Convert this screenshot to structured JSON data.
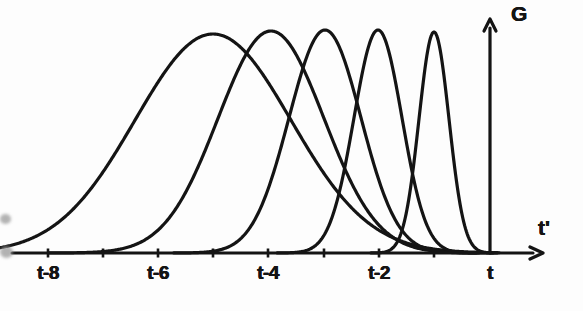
{
  "figure": {
    "background_color": "#fdfdfd",
    "ink_color": "#141414",
    "line_width_px": 3.2
  },
  "axes": {
    "x_axis": {
      "name": "x-axis",
      "label": "t'",
      "label_x": 538,
      "label_y": 216,
      "baseline_y": 253,
      "start_x": 12,
      "arrow_tip_x": 543,
      "tick_height_px": 9
    },
    "y_axis": {
      "name": "y-axis",
      "label": "G",
      "label_x": 511,
      "label_y": 2,
      "axis_x": 490,
      "base_y": 253,
      "arrow_tip_y": 19
    },
    "ticks": [
      {
        "x": 48,
        "label": "t-8",
        "labeled": true
      },
      {
        "x": 103,
        "label": "",
        "labeled": false
      },
      {
        "x": 158,
        "label": "t-6",
        "labeled": true
      },
      {
        "x": 213,
        "label": "",
        "labeled": false
      },
      {
        "x": 268,
        "label": "t-4",
        "labeled": true
      },
      {
        "x": 324,
        "label": "",
        "labeled": false
      },
      {
        "x": 379,
        "label": "t-2",
        "labeled": true
      },
      {
        "x": 434,
        "label": "",
        "labeled": false
      },
      {
        "x": 490,
        "label": "t",
        "labeled": true
      }
    ],
    "tick_label_y": 262
  },
  "chart_data": {
    "type": "line",
    "title": "",
    "xlabel": "t'",
    "ylabel": "G",
    "grid": false,
    "legend": null,
    "x_tick_values": [
      "t-8",
      "",
      "t-6",
      "",
      "t-4",
      "",
      "t-2",
      "",
      "t"
    ],
    "x_axis_units": "time before t (tick spacing = 1 unit)",
    "series": [
      {
        "name": "kernel-1",
        "center_label": "t-5",
        "center_x": 213,
        "sigma_px": 78,
        "peak_y": 34,
        "peak_height_rel": 1.0
      },
      {
        "name": "kernel-2",
        "center_label": "t-4",
        "center_x": 271,
        "sigma_px": 53,
        "peak_y": 31,
        "peak_height_rel": 1.0
      },
      {
        "name": "kernel-3",
        "center_label": "t-3",
        "center_x": 325,
        "sigma_px": 36,
        "peak_y": 30,
        "peak_height_rel": 1.0
      },
      {
        "name": "kernel-4",
        "center_label": "t-2",
        "center_x": 378,
        "sigma_px": 24,
        "peak_y": 30,
        "peak_height_rel": 1.0
      },
      {
        "name": "kernel-5",
        "center_label": "t-1",
        "center_x": 434,
        "sigma_px": 15,
        "peak_y": 32,
        "peak_height_rel": 1.0
      }
    ]
  },
  "artifacts": {
    "left_edge_smudges": [
      {
        "x": 0,
        "y": 214,
        "w": 11,
        "h": 10
      },
      {
        "x": 0,
        "y": 246,
        "w": 13,
        "h": 12
      }
    ]
  }
}
